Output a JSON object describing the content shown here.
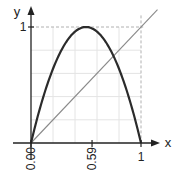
{
  "chart_data": {
    "type": "line",
    "title": "",
    "xlabel": "x",
    "ylabel": "y",
    "xlim": [
      0,
      1
    ],
    "ylim": [
      0,
      1
    ],
    "grid": true,
    "grid_divisions": 5,
    "x_ticks": [
      {
        "value": 0.0,
        "label": "0.00"
      },
      {
        "value": 0.555,
        "label": "0.59"
      },
      {
        "value": 1.0,
        "label": "1"
      }
    ],
    "y_ticks": [
      {
        "value": 1.0,
        "label": "1"
      }
    ],
    "reference_lines": [
      {
        "orientation": "horizontal",
        "value": 1,
        "style": "dashed"
      },
      {
        "orientation": "vertical",
        "value": 1,
        "style": "dashed"
      }
    ],
    "series": [
      {
        "name": "f(x) = 4x(1-x)",
        "style": "thick-dark",
        "x": [
          0,
          0.1,
          0.2,
          0.3,
          0.4,
          0.5,
          0.6,
          0.7,
          0.75,
          0.8,
          0.9,
          1.0
        ],
        "y": [
          0,
          0.36,
          0.64,
          0.84,
          0.96,
          1.0,
          0.96,
          0.84,
          0.75,
          0.64,
          0.36,
          0
        ]
      },
      {
        "name": "y = x",
        "style": "thin-gray",
        "x": [
          0,
          1.15
        ],
        "y": [
          0,
          1.15
        ]
      }
    ],
    "colors": {
      "curve": "#2b2b2b",
      "diagonal": "#8a8a8a",
      "axis": "#222222",
      "grid": "#e4e4e4",
      "dashed": "#b0b0b0"
    }
  },
  "labels": {
    "x_axis": "x",
    "y_axis": "y",
    "y_tick_1": "1",
    "x_tick_0": "0.00",
    "x_tick_mid": "0.59",
    "x_tick_1": "1"
  }
}
